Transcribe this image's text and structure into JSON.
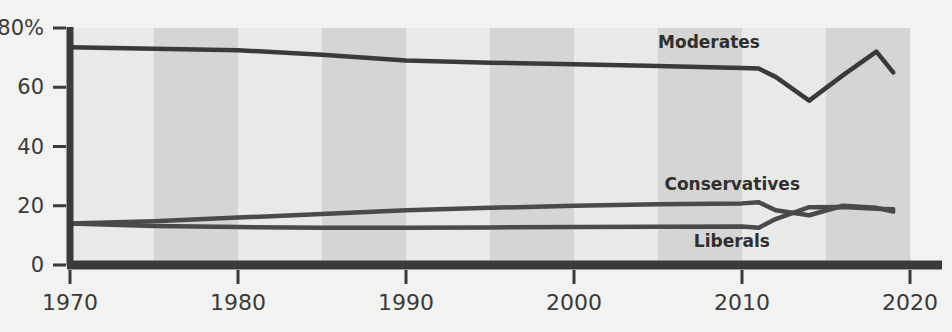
{
  "chart_data": {
    "type": "line",
    "title": "",
    "xlabel": "",
    "ylabel": "",
    "xlim": [
      1970,
      2020
    ],
    "ylim": [
      0,
      80
    ],
    "grid": false,
    "legend_position": "inline-right-of-line",
    "background_bands": {
      "note": "alternating vertical 5-year shaded bands",
      "light_color": "#e9e9e7",
      "dark_color": "#d5d5d3",
      "band_years": [
        1970,
        1975,
        1980,
        1985,
        1990,
        1995,
        2000,
        2005,
        2010,
        2015,
        2020
      ]
    },
    "x_ticks": [
      1970,
      1980,
      1990,
      2000,
      2010,
      2020
    ],
    "x_tick_labels": [
      "1970",
      "1980",
      "1990",
      "2000",
      "2010",
      "2020"
    ],
    "y_ticks": [
      0,
      20,
      40,
      60,
      80
    ],
    "y_tick_labels": [
      "0",
      "20",
      "40",
      "60",
      "80%"
    ],
    "series": [
      {
        "name": "Moderates",
        "label": "Moderates",
        "color": "#3a3a38",
        "x": [
          1970,
          1975,
          1980,
          1985,
          1990,
          1995,
          2000,
          2005,
          2010,
          2011,
          2012,
          2014,
          2016,
          2018,
          2019
        ],
        "values": [
          73.5,
          73.0,
          72.5,
          71.0,
          69.0,
          68.3,
          67.8,
          67.2,
          66.5,
          66.3,
          63.5,
          55.5,
          64.0,
          72.0,
          65.0
        ]
      },
      {
        "name": "Conservatives",
        "label": "Conservatives",
        "color": "#4a4a48",
        "x": [
          1970,
          1975,
          1980,
          1985,
          1990,
          1995,
          2000,
          2005,
          2010,
          2011,
          2012,
          2014,
          2016,
          2018,
          2019
        ],
        "values": [
          14.0,
          14.8,
          16.0,
          17.2,
          18.5,
          19.3,
          20.0,
          20.5,
          20.8,
          21.2,
          18.5,
          16.8,
          20.0,
          19.3,
          18.0
        ]
      },
      {
        "name": "Liberals",
        "label": "Liberals",
        "color": "#4a4a48",
        "x": [
          1970,
          1975,
          1980,
          1985,
          1990,
          1995,
          2000,
          2005,
          2010,
          2011,
          2012,
          2014,
          2016,
          2018,
          2019
        ],
        "values": [
          14.0,
          13.2,
          12.8,
          12.6,
          12.6,
          12.7,
          12.8,
          12.9,
          13.0,
          12.6,
          15.5,
          19.5,
          19.6,
          19.0,
          18.8
        ]
      }
    ],
    "annotations": [
      {
        "text": "Moderates",
        "series": "Moderates",
        "x_px": 760,
        "y_px": 48
      },
      {
        "text": "Conservatives",
        "series": "Conservatives",
        "x_px": 800,
        "y_px": 190
      },
      {
        "text": "Liberals",
        "series": "Liberals",
        "x_px": 770,
        "y_px": 247
      }
    ]
  },
  "colors": {
    "page_background": "#f2f2f0",
    "band_light": "#e9e9e7",
    "band_dark": "#d5d5d3",
    "axis": "#3a3a38",
    "line": "#3a3a38",
    "tick_text": "#3a3a38"
  }
}
